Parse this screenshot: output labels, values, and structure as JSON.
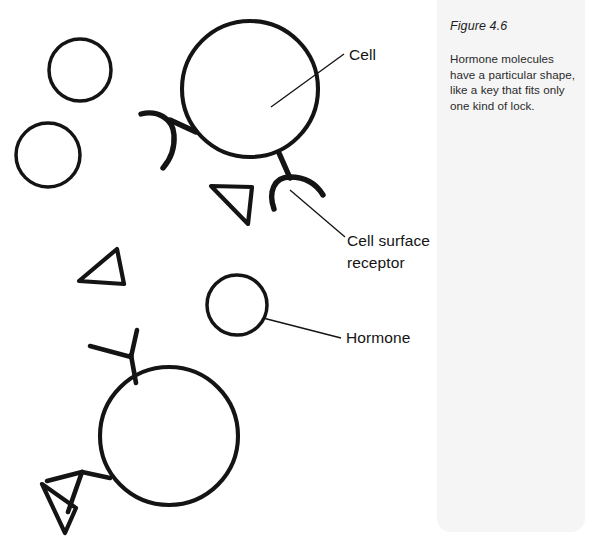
{
  "figure": {
    "number_label": "Figure 4.6",
    "caption": "Hormone molecules have a particular shape, like a key that fits only one kind of lock."
  },
  "labels": {
    "cell": "Cell",
    "cell_surface_receptor_line1": "Cell surface",
    "cell_surface_receptor_line2": "receptor",
    "hormone": "Hormone"
  },
  "colors": {
    "ink": "#141414",
    "panel_background": "#f5f5f5",
    "page_background": "#ffffff",
    "caption_text": "#2a2a2a"
  },
  "diagram": {
    "cells": [
      {
        "name": "top-cell",
        "cx": 250,
        "cy": 89,
        "r": 68,
        "receptor_shape": "cup",
        "receptors": [
          "upper-left-cup",
          "lower-right-cup"
        ],
        "bound_hormone": null
      },
      {
        "name": "bottom-cell",
        "cx": 169,
        "cy": 436,
        "r": 69,
        "receptor_shape": "wedge",
        "receptors": [
          "upper-left-wedge",
          "lower-left-wedge"
        ],
        "bound_hormone": "triangle"
      }
    ],
    "free_hormones": [
      {
        "name": "round-hormone-1",
        "shape": "circle",
        "cx": 80,
        "cy": 70,
        "r": 31
      },
      {
        "name": "round-hormone-2",
        "shape": "circle",
        "cx": 48,
        "cy": 155,
        "r": 32
      },
      {
        "name": "round-hormone-3",
        "shape": "circle",
        "cx": 237,
        "cy": 305,
        "r": 30
      },
      {
        "name": "triangle-hormone-1",
        "shape": "triangle",
        "cx": 231,
        "cy": 204
      },
      {
        "name": "triangle-hormone-2",
        "shape": "triangle",
        "cx": 98,
        "cy": 267
      }
    ]
  }
}
